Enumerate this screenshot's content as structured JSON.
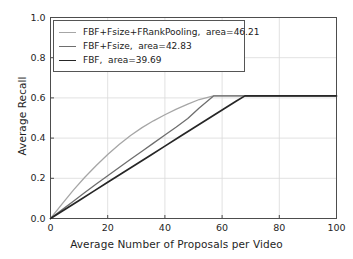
{
  "chart_data": {
    "type": "line",
    "title": "",
    "xlabel": "Average Number of Proposals per Video",
    "ylabel": "Average Recall",
    "xlim": [
      0,
      100
    ],
    "ylim": [
      0.0,
      1.0
    ],
    "xticks": [
      0,
      20,
      40,
      60,
      80,
      100
    ],
    "xtick_labels": [
      "0",
      "20",
      "40",
      "60",
      "80",
      "100"
    ],
    "yticks": [
      0.0,
      0.2,
      0.4,
      0.6,
      0.8,
      1.0
    ],
    "ytick_labels": [
      "0.0",
      "0.2",
      "0.4",
      "0.6",
      "0.8",
      "1.0"
    ],
    "grid": true,
    "legend_position": "upper left",
    "series": [
      {
        "name": "FBF+Fsize+FRankPooling,  area=46.21",
        "label": "FBF+Fsize+FRankPooling,  area=46.21",
        "area": 46.21,
        "color": "#a6a6a6",
        "linewidth": 1.3,
        "x": [
          0,
          4,
          8,
          12,
          16,
          20,
          24,
          28,
          32,
          36,
          40,
          44,
          48,
          52,
          57,
          62,
          70,
          80,
          90,
          100
        ],
        "y": [
          0.0,
          0.072,
          0.141,
          0.205,
          0.264,
          0.318,
          0.368,
          0.413,
          0.452,
          0.486,
          0.516,
          0.544,
          0.569,
          0.592,
          0.61,
          0.61,
          0.61,
          0.61,
          0.61,
          0.61
        ]
      },
      {
        "name": "FBF+Fsize,  area=42.83",
        "label": "FBF+Fsize,  area=42.83",
        "area": 42.83,
        "color": "#6e6e6e",
        "linewidth": 1.3,
        "x": [
          0,
          4,
          8,
          12,
          16,
          20,
          24,
          28,
          32,
          36,
          40,
          44,
          48,
          52,
          57,
          62,
          70,
          80,
          90,
          100
        ],
        "y": [
          0.0,
          0.043,
          0.086,
          0.129,
          0.172,
          0.213,
          0.254,
          0.295,
          0.335,
          0.375,
          0.415,
          0.455,
          0.497,
          0.55,
          0.61,
          0.61,
          0.61,
          0.61,
          0.61,
          0.61
        ]
      },
      {
        "name": "FBF,  area=39.69",
        "label": "FBF,  area=39.69",
        "area": 39.69,
        "color": "#262626",
        "linewidth": 1.7,
        "x": [
          0,
          5,
          10,
          15,
          20,
          25,
          30,
          35,
          40,
          45,
          50,
          55,
          60,
          65,
          68,
          75,
          85,
          95,
          100
        ],
        "y": [
          0.0,
          0.045,
          0.09,
          0.135,
          0.18,
          0.225,
          0.27,
          0.315,
          0.36,
          0.405,
          0.45,
          0.495,
          0.54,
          0.585,
          0.61,
          0.61,
          0.61,
          0.61,
          0.61
        ]
      }
    ]
  },
  "style": {
    "background": "#ffffff",
    "grid_color": "#d9d9d9",
    "axis_color": "#4d4d4d",
    "text_color": "#1f1f1f"
  }
}
